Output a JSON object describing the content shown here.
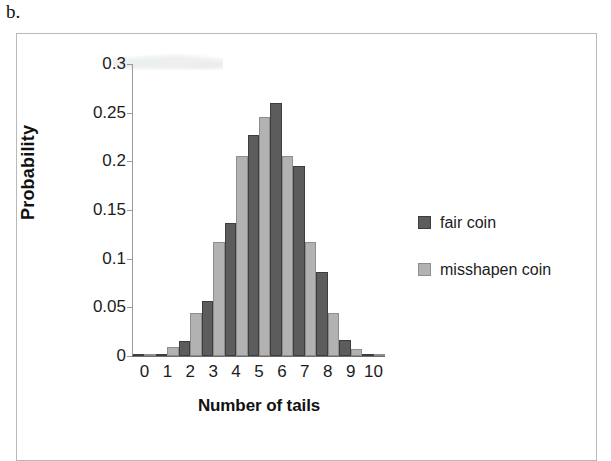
{
  "panel_letter": "b.",
  "chart_data": {
    "type": "bar",
    "title": "",
    "xlabel": "Number of tails",
    "ylabel": "Probability",
    "categories": [
      "0",
      "1",
      "2",
      "3",
      "4",
      "5",
      "6",
      "7",
      "8",
      "9",
      "10"
    ],
    "ylim": [
      0,
      0.3
    ],
    "ytick_values": [
      0.3,
      0.25,
      0.2,
      0.15,
      0.1,
      0.05,
      0
    ],
    "ytick_labels": [
      "0.3",
      "0.25",
      "0.2",
      "0.15",
      "0.1",
      "0.05",
      "0"
    ],
    "grid": false,
    "legend_position": "right",
    "series": [
      {
        "name": "fair coin",
        "color": "#5c5c5c",
        "values": [
          0.001,
          0.002,
          0.015,
          0.057,
          0.137,
          0.227,
          0.26,
          0.195,
          0.086,
          0.016,
          0.001
        ]
      },
      {
        "name": "misshapen coin",
        "color": "#b2b2b2",
        "values": [
          0.001,
          0.009,
          0.044,
          0.117,
          0.205,
          0.246,
          0.205,
          0.117,
          0.044,
          0.007,
          0.001
        ]
      }
    ]
  },
  "legend": {
    "items": [
      {
        "label": "fair coin",
        "swatch": "legend-swatch-fair-coin"
      },
      {
        "label": "misshapen coin",
        "swatch": "legend-swatch-misshapen-coin"
      }
    ]
  }
}
